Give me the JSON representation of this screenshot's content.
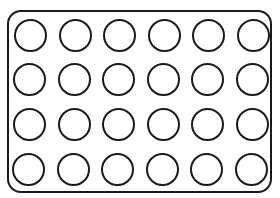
{
  "diagram": {
    "type": "well-plate",
    "rows": 4,
    "columns": 6,
    "total_wells": 24,
    "colors": {
      "stroke": "#1a1a1a",
      "fill": "#ffffff",
      "background": "#ffffff"
    }
  }
}
